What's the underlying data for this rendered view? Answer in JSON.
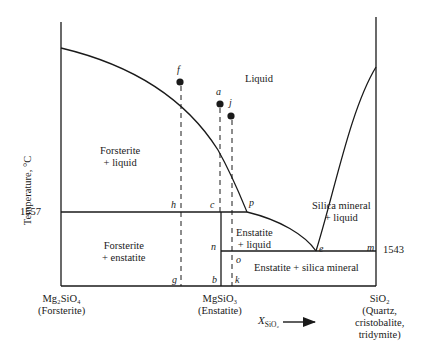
{
  "diagram": {
    "y_axis_label": "Temperature, °C",
    "x_axis_label": "X",
    "x_axis_sub": "SiO₂",
    "temperatures": {
      "peritectic": "1557",
      "eutectic": "1543"
    },
    "endmembers": {
      "left": {
        "formula": "Mg₂SiO₄",
        "name": "(Forsterite)"
      },
      "middle": {
        "formula": "MgSiO₃",
        "name": "(Enstatite)"
      },
      "right": {
        "formula": "SiO₂",
        "name_1": "(Quartz,",
        "name_2": "cristobalite,",
        "name_3": "tridymite)"
      }
    },
    "fields": {
      "liquid": "Liquid",
      "forsterite_liquid_1": "Forsterite",
      "forsterite_liquid_2": "+ liquid",
      "forsterite_enstatite_1": "Forsterite",
      "forsterite_enstatite_2": "+ enstatite",
      "enstatite_liquid_1": "Enstatite",
      "enstatite_liquid_2": "+ liquid",
      "silica_liquid_1": "Silica mineral",
      "silica_liquid_2": "+ liquid",
      "enstatite_silica": "Enstatite + silica mineral"
    },
    "points": {
      "f": "f",
      "a": "a",
      "j": "j",
      "h": "h",
      "c": "c",
      "p": "p",
      "n": "n",
      "o": "o",
      "e": "e",
      "m": "m",
      "g": "g",
      "b": "b",
      "k": "k"
    },
    "colors": {
      "line": "#1a1a1a",
      "background": "#ffffff"
    }
  }
}
